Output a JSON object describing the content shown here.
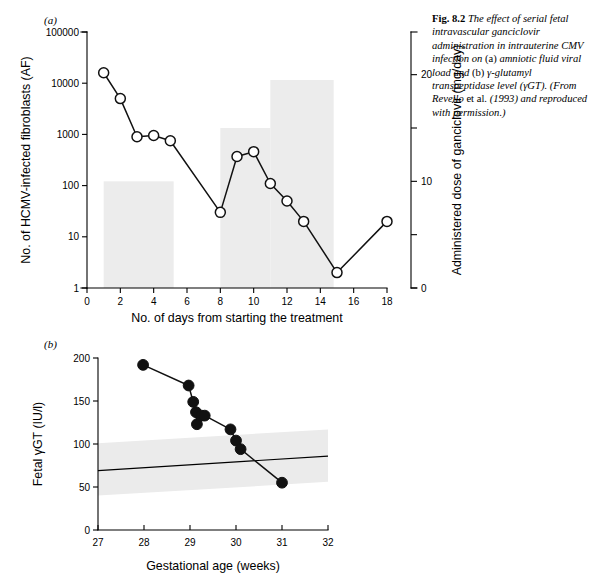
{
  "figure": {
    "caption_label": "Fig. 8.2",
    "caption_part1": "The effect of serial fetal intravascular ganciclovir administration in intrauterine CMV infection on ",
    "caption_a": "(a)",
    "caption_part2": " amniotic fluid viral load and ",
    "caption_b": "(b)",
    "caption_part3": " γ-glutamyl transpeptidase level (γGT). (From Revello ",
    "caption_roman1": "et al.",
    "caption_part4": " (1993) and reproduced with permission.)",
    "panel_a_letter": "(a)",
    "panel_b_letter": "(b)",
    "bar_color": "#ececec",
    "band_color": "#ebebeb",
    "line_color": "#111111"
  },
  "chart_data": [
    {
      "type": "line",
      "panel": "(a)",
      "title": "",
      "xlabel": "No. of days from starting the treatment",
      "ylabel": "No. of HCMV-infected fibroblasts (AF)",
      "y2label": "Administered dose of ganciclovir (mg/day)",
      "yscale": "log",
      "xlim": [
        0,
        18
      ],
      "ylim": [
        1,
        100000
      ],
      "y2lim": [
        0,
        24
      ],
      "xticks": [
        0,
        2,
        4,
        6,
        8,
        10,
        12,
        14,
        16,
        18
      ],
      "xticklabels": [
        "0",
        "2",
        "4",
        "6",
        "8",
        "10",
        "12",
        "14",
        "16",
        "18"
      ],
      "yticks": [
        1,
        10,
        100,
        1000,
        10000,
        100000
      ],
      "yticklabels": [
        "1",
        "10",
        "100",
        "1000",
        "10000",
        "100000"
      ],
      "y2ticks": [
        0,
        5,
        10,
        15,
        20
      ],
      "y2ticklabels": [
        "0",
        "",
        "10",
        "",
        "20"
      ],
      "grid": false,
      "legend": "none",
      "series": [
        {
          "name": "HCMV-infected fibroblasts (AF)",
          "marker": "open-circle",
          "x": [
            1,
            2,
            3,
            4,
            5,
            8,
            9,
            10,
            11,
            12,
            13,
            15,
            18
          ],
          "y": [
            16000,
            5000,
            900,
            950,
            750,
            30,
            370,
            460,
            110,
            50,
            20,
            2,
            20
          ]
        }
      ],
      "bars": [
        {
          "name": "dose-bar-1",
          "x_start": 1,
          "x_end": 5.2,
          "dose": 10
        },
        {
          "name": "dose-bar-2",
          "x_start": 8,
          "x_end": 11,
          "dose": 15
        },
        {
          "name": "dose-bar-3",
          "x_start": 11,
          "x_end": 14.8,
          "dose": 19.5
        }
      ]
    },
    {
      "type": "scatter",
      "panel": "(b)",
      "title": "",
      "xlabel": "Gestational age (weeks)",
      "ylabel": "Fetal γGT (IU/l)",
      "yscale": "linear",
      "xlim": [
        27,
        32
      ],
      "ylim": [
        0,
        200
      ],
      "xticks": [
        27,
        28,
        29,
        30,
        31,
        32
      ],
      "xticklabels": [
        "27",
        "28",
        "29",
        "30",
        "31",
        "32"
      ],
      "yticks": [
        0,
        50,
        100,
        150,
        200
      ],
      "yticklabels": [
        "0",
        "50",
        "100",
        "150",
        "200"
      ],
      "grid": false,
      "legend": "none",
      "series": [
        {
          "name": "Fetal γGT",
          "marker": "filled-circle",
          "x": [
            27.98,
            28.97,
            29.07,
            29.13,
            29.15,
            29.25,
            29.32,
            29.88,
            30.0,
            30.1,
            31.0
          ],
          "y": [
            192,
            168,
            149,
            137,
            123,
            133,
            133,
            117,
            104,
            94,
            55
          ]
        }
      ],
      "reference_band": {
        "name": "normal-range-band",
        "x": [
          27,
          32
        ],
        "upper": [
          101,
          117
        ],
        "lower": [
          40,
          56
        ]
      },
      "reference_line": {
        "name": "normal-mean-line",
        "x": [
          27,
          32
        ],
        "y": [
          69,
          86
        ]
      }
    }
  ]
}
